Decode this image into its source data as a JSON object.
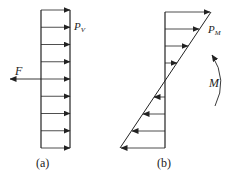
{
  "panels": [
    {
      "id": "a",
      "caption": "(a)",
      "load_label": "P",
      "load_subscript": "V",
      "force_label": "F",
      "arrow_count": 9,
      "distribution": "uniform"
    },
    {
      "id": "b",
      "caption": "(b)",
      "load_label": "P",
      "load_subscript": "M",
      "moment_label": "M",
      "arrow_count": 8,
      "distribution": "linear"
    }
  ],
  "colors": {
    "stroke": "#222222",
    "background": "#ffffff"
  }
}
